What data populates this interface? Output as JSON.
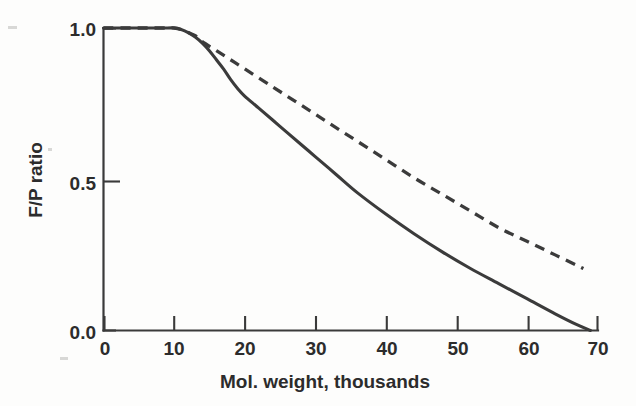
{
  "chart_data": {
    "type": "line",
    "title": "",
    "xlabel": "Mol. weight, thousands",
    "ylabel": "F/P ratio",
    "xlim": [
      0,
      70
    ],
    "ylim": [
      0.0,
      1.0
    ],
    "xticks": [
      0,
      10,
      20,
      30,
      40,
      50,
      60,
      70
    ],
    "xtick_labels": [
      "0",
      "10",
      "20",
      "30",
      "40",
      "50",
      "60",
      "70"
    ],
    "yticks": [
      0.0,
      0.5,
      1.0
    ],
    "ytick_labels": [
      "0.0",
      "0.5",
      "1.0"
    ],
    "grid": false,
    "legend": "none",
    "line_color": "#3b3b3b",
    "background_color": "#fdfdfc",
    "series": [
      {
        "name": "solid-curve",
        "style": "solid",
        "x": [
          0,
          5,
          9,
          10,
          11,
          12,
          13,
          14,
          15,
          16,
          17,
          18,
          19,
          20,
          22,
          25,
          28,
          30,
          33,
          36,
          40,
          44,
          48,
          52,
          56,
          60,
          64,
          67,
          69
        ],
        "values": [
          1.0,
          1.0,
          1.0,
          1.0,
          0.995,
          0.985,
          0.97,
          0.95,
          0.925,
          0.895,
          0.865,
          0.83,
          0.8,
          0.775,
          0.735,
          0.675,
          0.615,
          0.575,
          0.515,
          0.455,
          0.385,
          0.32,
          0.26,
          0.205,
          0.155,
          0.105,
          0.055,
          0.02,
          0.0
        ]
      },
      {
        "name": "dashed-curve",
        "style": "dashed",
        "x": [
          0,
          5,
          9,
          10,
          11,
          12,
          13,
          14,
          16,
          18,
          20,
          24,
          28,
          32,
          36,
          40,
          44,
          48,
          52,
          56,
          60,
          64,
          68
        ],
        "values": [
          1.0,
          1.0,
          1.0,
          1.0,
          0.995,
          0.985,
          0.975,
          0.955,
          0.925,
          0.895,
          0.865,
          0.805,
          0.745,
          0.685,
          0.625,
          0.565,
          0.505,
          0.45,
          0.395,
          0.34,
          0.295,
          0.25,
          0.205
        ]
      }
    ]
  },
  "figure": {
    "caption": ""
  }
}
